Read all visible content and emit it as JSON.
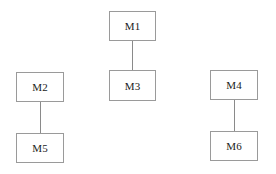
{
  "diagram": {
    "nodes": [
      {
        "id": "M1",
        "label": "M1"
      },
      {
        "id": "M2",
        "label": "M2"
      },
      {
        "id": "M3",
        "label": "M3"
      },
      {
        "id": "M4",
        "label": "M4"
      },
      {
        "id": "M5",
        "label": "M5"
      },
      {
        "id": "M6",
        "label": "M6"
      }
    ],
    "edges": [
      {
        "from": "M1",
        "to": "M3"
      },
      {
        "from": "M2",
        "to": "M5"
      },
      {
        "from": "M4",
        "to": "M6"
      }
    ]
  }
}
